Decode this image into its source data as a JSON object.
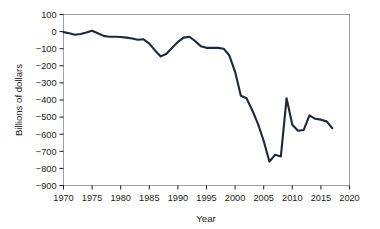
{
  "chart_data": {
    "type": "line",
    "title": "",
    "xlabel": "Year",
    "ylabel": "Billions of dollars",
    "xlim": [
      1970,
      2020
    ],
    "ylim": [
      -900,
      100
    ],
    "xticks": [
      1970,
      1975,
      1980,
      1985,
      1990,
      1995,
      2000,
      2005,
      2010,
      2015,
      2020
    ],
    "yticks": [
      100,
      0,
      -100,
      -200,
      -300,
      -400,
      -500,
      -600,
      -700,
      -800,
      -900
    ],
    "grid": false,
    "legend": null,
    "line_color": "#1b2a3a",
    "x": [
      1970,
      1971,
      1972,
      1973,
      1974,
      1975,
      1976,
      1977,
      1978,
      1979,
      1980,
      1981,
      1982,
      1983,
      1984,
      1985,
      1986,
      1987,
      1988,
      1989,
      1990,
      1991,
      1992,
      1993,
      1994,
      1995,
      1996,
      1997,
      1998,
      1999,
      2000,
      2001,
      2002,
      2003,
      2004,
      2005,
      2006,
      2007,
      2008,
      2009,
      2010,
      2011,
      2012,
      2013,
      2014,
      2015,
      2016,
      2017
    ],
    "values": [
      -3,
      -10,
      -18,
      -14,
      -5,
      5,
      -10,
      -25,
      -30,
      -30,
      -32,
      -35,
      -40,
      -48,
      -45,
      -70,
      -110,
      -145,
      -130,
      -95,
      -60,
      -35,
      -30,
      -55,
      -85,
      -95,
      -95,
      -95,
      -100,
      -140,
      -235,
      -375,
      -390,
      -460,
      -540,
      -640,
      -760,
      -720,
      -730,
      -390,
      -545,
      -580,
      -575,
      -490,
      -510,
      -515,
      -525,
      -565
    ],
    "annotations": []
  },
  "axis": {
    "x_tick_labels": [
      "1970",
      "1975",
      "1980",
      "1985",
      "1990",
      "1995",
      "2000",
      "2005",
      "2010",
      "2015",
      "2020"
    ],
    "y_tick_labels": [
      "100",
      "0",
      "−100",
      "−200",
      "−300",
      "−400",
      "−500",
      "−600",
      "−700",
      "−800",
      "−900"
    ],
    "x_title": "Year",
    "y_title": "Billions of dollars"
  },
  "colors": {
    "line": "#1b2a3a",
    "border": "#9aa0a6",
    "text": "#1a1a1a",
    "background": "#ffffff"
  }
}
